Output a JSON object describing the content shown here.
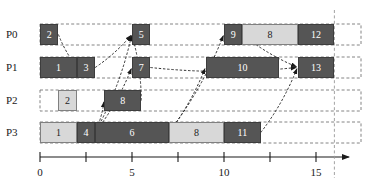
{
  "colors": {
    "dark_block": "#555555",
    "light_block": "#d8d8d8",
    "lane_border": "#777777",
    "axis": "#1a1a1a",
    "arrow": "#1a1a1a",
    "marker_line": "#999999"
  },
  "axis": {
    "label": "",
    "min": 0,
    "max": 17,
    "tick_interval": 2.5,
    "tick_labels": [
      "0",
      "5",
      "10",
      "15"
    ],
    "tick_label_values": [
      0,
      5,
      10,
      15
    ],
    "minor_ticks": [
      2.5,
      7.5,
      12.5
    ],
    "marker_line_value": 16
  },
  "lanes": [
    {
      "name": "P0",
      "label": "P0",
      "blocks": [
        {
          "label": "2",
          "start": 0,
          "end": 1,
          "shade": "dark"
        },
        {
          "label": "5",
          "start": 5,
          "end": 6,
          "shade": "dark"
        },
        {
          "label": "9",
          "start": 10,
          "end": 11,
          "shade": "dark"
        },
        {
          "label": "8",
          "start": 11,
          "end": 14,
          "shade": "light"
        },
        {
          "label": "12",
          "start": 14,
          "end": 16,
          "shade": "dark"
        }
      ]
    },
    {
      "name": "P1",
      "label": "P1",
      "blocks": [
        {
          "label": "1",
          "start": 0,
          "end": 2,
          "shade": "dark"
        },
        {
          "label": "3",
          "start": 2,
          "end": 3,
          "shade": "dark"
        },
        {
          "label": "7",
          "start": 5,
          "end": 6,
          "shade": "dark"
        },
        {
          "label": "10",
          "start": 9,
          "end": 13,
          "shade": "dark"
        },
        {
          "label": "13",
          "start": 14,
          "end": 16,
          "shade": "dark"
        }
      ]
    },
    {
      "name": "P2",
      "label": "P2",
      "blocks": [
        {
          "label": "2",
          "start": 1,
          "end": 2,
          "shade": "light"
        },
        {
          "label": "8",
          "start": 3.5,
          "end": 5.5,
          "shade": "dark"
        }
      ]
    },
    {
      "name": "P3",
      "label": "P3",
      "blocks": [
        {
          "label": "1",
          "start": 0,
          "end": 2,
          "shade": "light"
        },
        {
          "label": "4",
          "start": 2,
          "end": 3,
          "shade": "dark"
        },
        {
          "label": "6",
          "start": 3,
          "end": 7,
          "shade": "dark"
        },
        {
          "label": "8",
          "start": 7,
          "end": 10,
          "shade": "light"
        },
        {
          "label": "11",
          "start": 10,
          "end": 12,
          "shade": "dark"
        }
      ]
    }
  ],
  "dependencies": [
    {
      "from_lane": "P0",
      "from_value": 1,
      "to_lane": "P1",
      "to_value": 2
    },
    {
      "from_lane": "P2",
      "from_value": 5.5,
      "to_lane": "P0",
      "to_value": 5
    },
    {
      "from_lane": "P3",
      "from_value": 3,
      "to_lane": "P0",
      "to_value": 5
    },
    {
      "from_lane": "P3",
      "from_value": 3,
      "to_lane": "P1",
      "to_value": 5
    },
    {
      "from_lane": "P1",
      "from_value": 3,
      "to_lane": "P0",
      "to_value": 5
    },
    {
      "from_lane": "P3",
      "from_value": 3,
      "to_lane": "P2",
      "to_value": 3.5
    },
    {
      "from_lane": "P3",
      "from_value": 7,
      "to_lane": "P0",
      "to_value": 10
    },
    {
      "from_lane": "P3",
      "from_value": 7,
      "to_lane": "P1",
      "to_value": 9
    },
    {
      "from_lane": "P0",
      "from_value": 11,
      "to_lane": "P0",
      "to_value": 14
    },
    {
      "from_lane": "P0",
      "from_value": 11,
      "to_lane": "P1",
      "to_value": 14
    },
    {
      "from_lane": "P1",
      "from_value": 6,
      "to_lane": "P1",
      "to_value": 14
    },
    {
      "from_lane": "P3",
      "from_value": 12,
      "to_lane": "P1",
      "to_value": 14
    }
  ]
}
